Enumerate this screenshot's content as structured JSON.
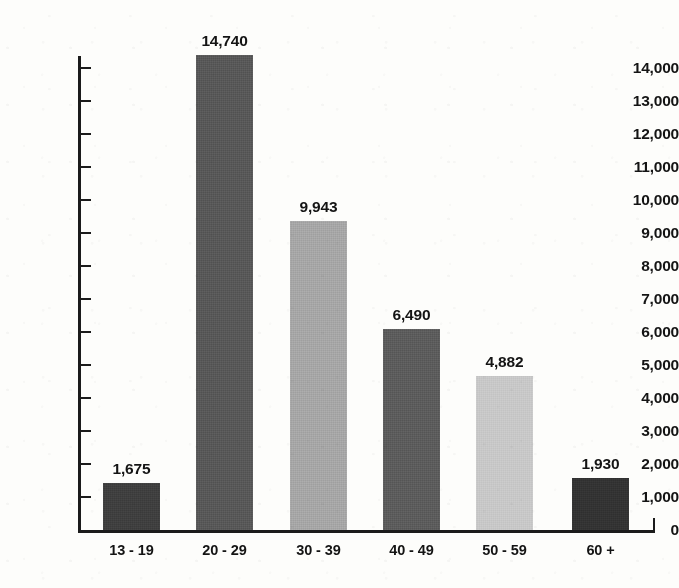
{
  "chart_data": {
    "type": "bar",
    "title": "",
    "subtitle": "",
    "xlabel": "",
    "ylabel": "",
    "categories": [
      "13 - 19",
      "20 - 29",
      "30 - 39",
      "40 - 49",
      "50 - 59",
      "60 +"
    ],
    "values": [
      1675,
      14740,
      9943,
      6490,
      4882,
      1930
    ],
    "value_labels": [
      "1,675",
      "14,740",
      "9,943",
      "6,490",
      "4,882",
      "1,930"
    ],
    "bar_colors": [
      "#3f3f3f",
      "#585858",
      "#a6a6a6",
      "#5c5c5c",
      "#c8c8c8",
      "#333333"
    ],
    "ylim": [
      0,
      14000
    ],
    "ytick_values": [
      0,
      1000,
      2000,
      3000,
      4000,
      5000,
      6000,
      7000,
      8000,
      9000,
      10000,
      11000,
      12000,
      13000,
      14000
    ],
    "ytick_labels": [
      "0",
      "1,000",
      "2,000",
      "3,000",
      "4,000",
      "5,000",
      "6,000",
      "7,000",
      "8,000",
      "9,000",
      "10,000",
      "11,000",
      "12,000",
      "13,000",
      "14,000"
    ],
    "grid": false,
    "legend": false,
    "legend_position": "none",
    "axis_color": "#1b1b1b",
    "background_color": "#fdfdfb",
    "plot_pixel_bar_tops": [
      1430,
      14400,
      9350,
      6100,
      4680,
      1570
    ]
  }
}
